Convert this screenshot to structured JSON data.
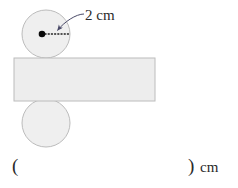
{
  "figure": {
    "shapes": {
      "top_circle": {
        "name": "top-roller",
        "cx": 46,
        "cy": 34,
        "r": 24,
        "fill": "#efefef",
        "stroke": "#b9b9b9"
      },
      "bottom_circle": {
        "name": "bottom-roller",
        "cx": 46,
        "cy": 123,
        "r": 24,
        "fill": "#efefef",
        "stroke": "#b9b9b9"
      },
      "rectangle": {
        "name": "belt-band",
        "x": 14,
        "y": 58,
        "width": 141,
        "height": 43,
        "fill": "#ededed",
        "stroke": "#b9b9b9"
      },
      "center_dot": {
        "name": "center-point",
        "cx": 42,
        "cy": 34,
        "r": 3.2,
        "fill": "#000000"
      },
      "radius_line": {
        "name": "radius-dotted-line",
        "x1": 45,
        "y1": 34,
        "x2": 69,
        "y2": 34,
        "stroke": "#1a1a1a",
        "dash": "1,2"
      },
      "leader_arrow": {
        "name": "dimension-leader-arrow",
        "from_x": 83,
        "from_y": 14,
        "to_x": 56,
        "to_y": 31,
        "stroke": "#4a4a68"
      }
    },
    "labels": {
      "radius_label": "2 cm"
    }
  },
  "answer": {
    "open_paren": "(",
    "close_paren": ")",
    "unit": "cm",
    "value": ""
  },
  "colors": {
    "shape_fill": "#efefef",
    "shape_stroke": "#b9b9b9",
    "text": "#2a2a2a",
    "arrow": "#4a4a68"
  }
}
